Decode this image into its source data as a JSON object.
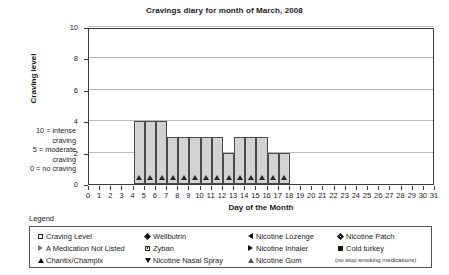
{
  "chart_data": {
    "type": "bar",
    "title": "Cravings diary for month of March, 2008",
    "xlabel": "Day of the Month",
    "ylabel": "Craving level",
    "xlim": [
      0,
      31
    ],
    "ylim": [
      0,
      10
    ],
    "grid": true,
    "x_ticks": [
      0,
      1,
      2,
      3,
      4,
      5,
      6,
      7,
      8,
      9,
      10,
      11,
      12,
      13,
      14,
      15,
      16,
      17,
      18,
      19,
      20,
      21,
      22,
      23,
      24,
      25,
      26,
      27,
      28,
      29,
      30,
      31
    ],
    "y_ticks": [
      0,
      2,
      4,
      6,
      8,
      10
    ],
    "categories": [
      5,
      6,
      7,
      8,
      9,
      10,
      11,
      12,
      13,
      14,
      15,
      16,
      17,
      18
    ],
    "values": [
      4,
      4,
      4,
      3,
      3,
      3,
      3,
      3,
      2,
      3,
      3,
      3,
      2,
      2
    ],
    "marker": "A Medication Not Listed",
    "annotations": [
      "10 = intense",
      "craving",
      "5 = moderate",
      "craving",
      "0 = no craving"
    ]
  },
  "legend": {
    "label": "Legend",
    "note": "(no stop smoking medications)",
    "columns": [
      {
        "items": [
          {
            "glyph": "square-open-icon",
            "label": "Craving Level"
          },
          {
            "glyph": "triangle-right-open-icon",
            "label": "A Medication Not Listed"
          },
          {
            "glyph": "triangle-up-filled-icon",
            "label": "Chantix/Champix"
          }
        ]
      },
      {
        "items": [
          {
            "glyph": "diamond-filled-icon",
            "label": "Wellbutrin"
          },
          {
            "glyph": "square-dot-icon",
            "label": "Zyban"
          },
          {
            "glyph": "triangle-down-filled-icon",
            "label": "Nicotine Nasal Spray"
          }
        ]
      },
      {
        "items": [
          {
            "glyph": "triangle-left-filled-icon",
            "label": "Nicotine Lozenge"
          },
          {
            "glyph": "triangle-right-filled-icon",
            "label": "Nicotine Inhaler"
          },
          {
            "glyph": "triangle-up-open-icon",
            "label": "Nicotine Gum"
          }
        ]
      },
      {
        "items": [
          {
            "glyph": "diamond-dot-icon",
            "label": "Nicotine Patch"
          },
          {
            "glyph": "square-filled-icon",
            "label": "Cold turkey"
          }
        ]
      }
    ]
  }
}
